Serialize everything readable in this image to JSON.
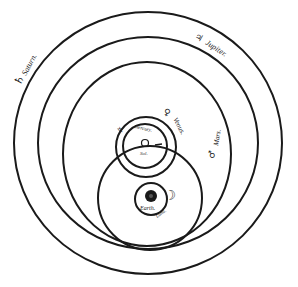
{
  "labels": {
    "saturn": "Saturn.",
    "jupiter": "Jupiter.",
    "mars": "Mars.",
    "venus": "Venus.",
    "mercury": "Mercury.",
    "sun": "Sol.",
    "earth": "Earth.",
    "moon": "Luna."
  },
  "symbols": {
    "saturn": "♄",
    "jupiter": "♃",
    "mars": "♂",
    "venus": "♀",
    "mercury": "☿",
    "sun": "☉",
    "moon": "☾"
  },
  "colors": {
    "ink": "#1a1a1a",
    "paper": "#ffffff"
  }
}
